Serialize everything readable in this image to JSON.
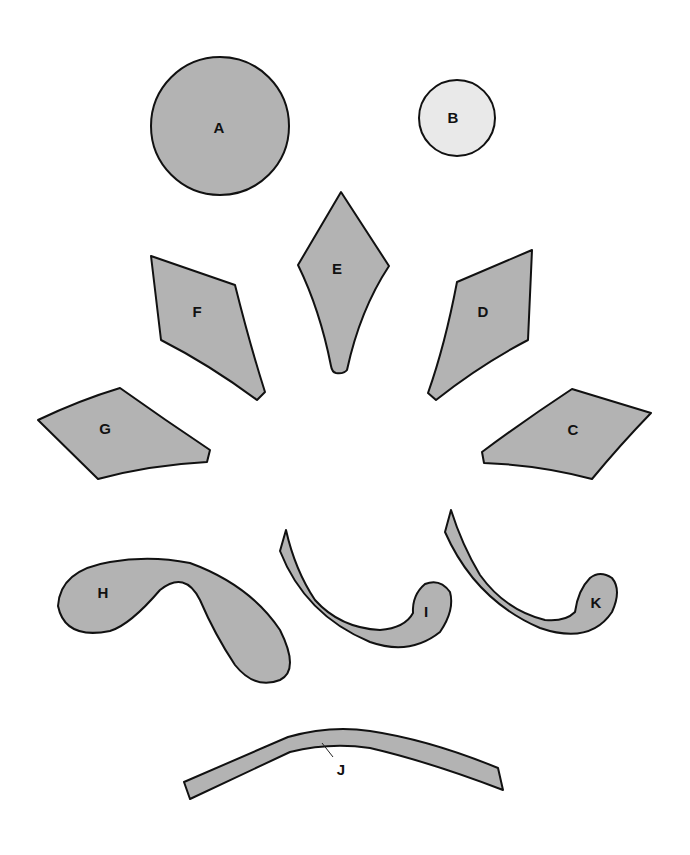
{
  "figure": {
    "colors": {
      "fill_dark": "#b3b3b3",
      "fill_light": "#e9e9e9",
      "outline": "#111111",
      "background": "#ffffff"
    },
    "pieces": [
      {
        "id": "A",
        "label": "A",
        "shape": "large-circle",
        "fill": "dark"
      },
      {
        "id": "B",
        "label": "B",
        "shape": "small-circle",
        "fill": "light"
      },
      {
        "id": "C",
        "label": "C",
        "shape": "petal-quad",
        "fill": "dark"
      },
      {
        "id": "D",
        "label": "D",
        "shape": "petal-quad",
        "fill": "dark"
      },
      {
        "id": "E",
        "label": "E",
        "shape": "diamond-petal",
        "fill": "dark"
      },
      {
        "id": "F",
        "label": "F",
        "shape": "petal-quad",
        "fill": "dark"
      },
      {
        "id": "G",
        "label": "G",
        "shape": "petal-quad",
        "fill": "dark"
      },
      {
        "id": "H",
        "label": "H",
        "shape": "curved-leaf",
        "fill": "dark"
      },
      {
        "id": "I",
        "label": "I",
        "shape": "hook-stem",
        "fill": "dark"
      },
      {
        "id": "J",
        "label": "J",
        "shape": "arched-band",
        "fill": "dark"
      },
      {
        "id": "K",
        "label": "K",
        "shape": "hook-stem",
        "fill": "dark"
      }
    ]
  }
}
